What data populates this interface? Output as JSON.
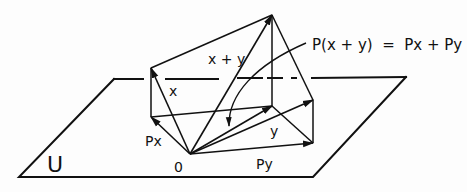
{
  "diagram": {
    "equation": "P(x + y)  =  Px + Py",
    "labels": {
      "subspace": "U",
      "origin": "0",
      "x": "x",
      "y": "y",
      "sum": "x + y",
      "px": "Px",
      "py": "Py"
    },
    "points": {
      "origin": [
        190,
        154
      ],
      "x": [
        151,
        68
      ],
      "px": [
        151,
        117
      ],
      "y": [
        313,
        100
      ],
      "py": [
        313,
        143
      ],
      "x_plus_y": [
        272,
        15
      ],
      "px_plus_py": [
        272,
        106
      ]
    },
    "plane": {
      "corners": [
        [
          19,
          177
        ],
        [
          313,
          177
        ],
        [
          406,
          77
        ],
        [
          114,
          79
        ]
      ]
    },
    "colors": {
      "ink": "#111111",
      "background": "#fdfdfd"
    }
  }
}
